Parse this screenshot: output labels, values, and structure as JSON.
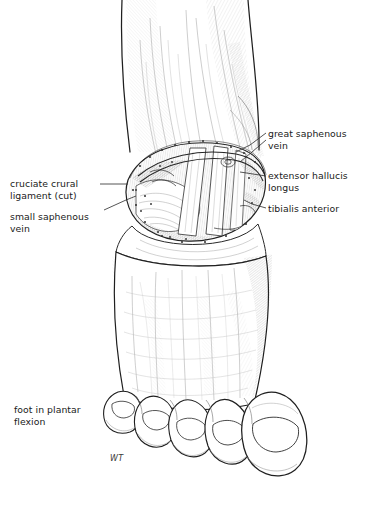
{
  "figure": {
    "background_color": "#ffffff",
    "ink_color": "#1a1a1a",
    "text_color": "#1a1a1a"
  },
  "labels": {
    "great_saphenous_vein": "great saphenous\nvein",
    "extensor_hallucis_longus": "extensor hallucis\nlongus",
    "tibialis_anterior": "tibialis anterior",
    "cruciate_crural_ligament": "cruciate crural\nligament (cut)",
    "small_saphenous_vein": "small saphenous\nvein",
    "foot_in_plantar_flexion": "foot in plantar\nflexion"
  },
  "signature": {
    "monogram": "WT"
  }
}
